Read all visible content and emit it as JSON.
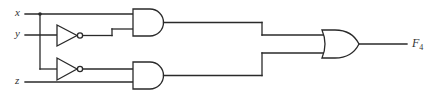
{
  "diagram": {
    "type": "logic-circuit",
    "inputs": [
      {
        "id": "x",
        "label": "x"
      },
      {
        "id": "y",
        "label": "y"
      },
      {
        "id": "z",
        "label": "z"
      }
    ],
    "output": {
      "label": "F",
      "subscript": "4"
    },
    "gates": [
      {
        "id": "not1",
        "type": "NOT",
        "inputs": [
          "y"
        ]
      },
      {
        "id": "not2",
        "type": "NOT",
        "inputs": [
          "x"
        ]
      },
      {
        "id": "and1",
        "type": "AND",
        "inputs": [
          "x",
          "not1"
        ]
      },
      {
        "id": "and2",
        "type": "AND",
        "inputs": [
          "not2",
          "z"
        ]
      },
      {
        "id": "or1",
        "type": "OR",
        "inputs": [
          "and1",
          "and2"
        ],
        "output": "F4"
      }
    ],
    "expression": "F4 = x·y' + x'·z",
    "colors": {
      "line": "#2a2a2a",
      "background": "#ffffff"
    }
  }
}
